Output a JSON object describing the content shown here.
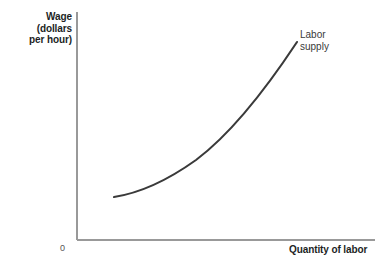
{
  "chart_data": {
    "type": "line",
    "title": "",
    "ylabel": "Wage (dollars per hour)",
    "ylabel_lines": [
      "Wage",
      "(dollars",
      "per hour)"
    ],
    "xlabel": "Quantity of labor",
    "origin_label": "0",
    "grid": false,
    "legend_position": "inline-end-of-curve",
    "axis_color": "#999999",
    "curve_color": "#3a3a3a",
    "background_color": "#ffffff",
    "text_color": "#221f1f",
    "xlim": [
      0,
      100
    ],
    "ylim": [
      0,
      100
    ],
    "axes_ticks": [],
    "series": [
      {
        "name": "Labor supply",
        "name_lines": [
          "Labor",
          "supply"
        ],
        "shape": "upward-sloping convex curve",
        "points": [
          {
            "x": 114,
            "y": 197
          },
          {
            "x": 136,
            "y": 193
          },
          {
            "x": 155,
            "y": 188
          },
          {
            "x": 178,
            "y": 175
          },
          {
            "x": 200,
            "y": 156
          },
          {
            "x": 226,
            "y": 133
          },
          {
            "x": 252,
            "y": 108
          },
          {
            "x": 275,
            "y": 77
          },
          {
            "x": 297,
            "y": 42
          }
        ],
        "path": "M114,197 C140,193 168,180 196,160 C228,136 260,98 297,42"
      }
    ],
    "axes": {
      "y_axis": {
        "x": 77,
        "y_top": 12,
        "y_bottom": 240
      },
      "x_axis": {
        "y": 240,
        "x_left": 77,
        "x_right": 375
      }
    }
  }
}
